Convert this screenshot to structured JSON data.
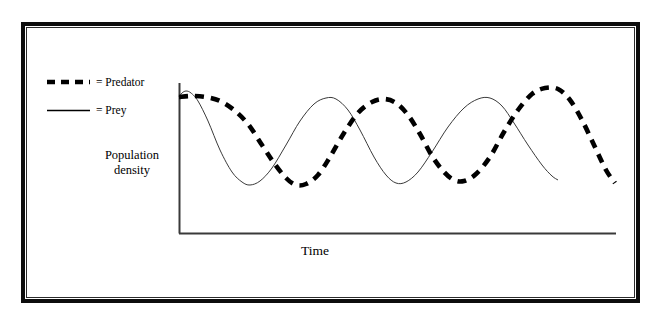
{
  "figure": {
    "legend": {
      "items": [
        {
          "key": "predator",
          "label": "= Predator",
          "style": "dashed",
          "color": "#000000"
        },
        {
          "key": "prey",
          "label": "= Prey",
          "style": "solid",
          "color": "#000000"
        }
      ]
    },
    "axes": {
      "y_title": "Population\ndensity",
      "y_title_line1": "Population",
      "y_title_line2": "density",
      "x_title": "Time",
      "axis_color": "#3a3a3a"
    },
    "frame_color": "#0d0d0d",
    "background": "#ffffff"
  },
  "chart_data": {
    "type": "line",
    "title": "",
    "subtitle": "",
    "xlabel": "Time",
    "ylabel": "Population density",
    "grid": false,
    "legend_position": "top-left-outside",
    "axis_ticks": {
      "x": [],
      "y": []
    },
    "xlim": [
      0,
      1
    ],
    "ylim": [
      0,
      1
    ],
    "series": [
      {
        "name": "Prey",
        "style": "solid",
        "color": "#3a3a3a",
        "line_width": 1,
        "points": [
          [
            179,
            97
          ],
          [
            182,
            93
          ],
          [
            186,
            91
          ],
          [
            191,
            93
          ],
          [
            198,
            101
          ],
          [
            208,
            121
          ],
          [
            220,
            150
          ],
          [
            232,
            172
          ],
          [
            242,
            182
          ],
          [
            250,
            185
          ],
          [
            260,
            181
          ],
          [
            272,
            168
          ],
          [
            286,
            145
          ],
          [
            300,
            121
          ],
          [
            314,
            104
          ],
          [
            326,
            98
          ],
          [
            336,
            99
          ],
          [
            348,
            110
          ],
          [
            360,
            130
          ],
          [
            374,
            157
          ],
          [
            386,
            175
          ],
          [
            396,
            183
          ],
          [
            406,
            182
          ],
          [
            418,
            172
          ],
          [
            432,
            152
          ],
          [
            448,
            127
          ],
          [
            464,
            108
          ],
          [
            478,
            99
          ],
          [
            490,
            98
          ],
          [
            502,
            106
          ],
          [
            514,
            123
          ],
          [
            528,
            145
          ],
          [
            542,
            165
          ],
          [
            552,
            176
          ],
          [
            558,
            180
          ]
        ]
      },
      {
        "name": "Predator",
        "style": "dashed",
        "color": "#000000",
        "line_width": 4.6,
        "dash_pattern": [
          9,
          7
        ],
        "points": [
          [
            179,
            97
          ],
          [
            192,
            96
          ],
          [
            206,
            97
          ],
          [
            220,
            101
          ],
          [
            234,
            110
          ],
          [
            248,
            124
          ],
          [
            262,
            145
          ],
          [
            274,
            163
          ],
          [
            286,
            178
          ],
          [
            296,
            185
          ],
          [
            306,
            184
          ],
          [
            318,
            175
          ],
          [
            330,
            157
          ],
          [
            344,
            133
          ],
          [
            358,
            113
          ],
          [
            372,
            102
          ],
          [
            384,
            99
          ],
          [
            396,
            103
          ],
          [
            408,
            115
          ],
          [
            420,
            134
          ],
          [
            432,
            156
          ],
          [
            444,
            172
          ],
          [
            454,
            180
          ],
          [
            464,
            181
          ],
          [
            476,
            174
          ],
          [
            490,
            157
          ],
          [
            504,
            132
          ],
          [
            518,
            110
          ],
          [
            532,
            94
          ],
          [
            545,
            88
          ],
          [
            558,
            89
          ],
          [
            570,
            100
          ],
          [
            582,
            120
          ],
          [
            594,
            145
          ],
          [
            606,
            170
          ],
          [
            615,
            183
          ]
        ]
      }
    ]
  }
}
